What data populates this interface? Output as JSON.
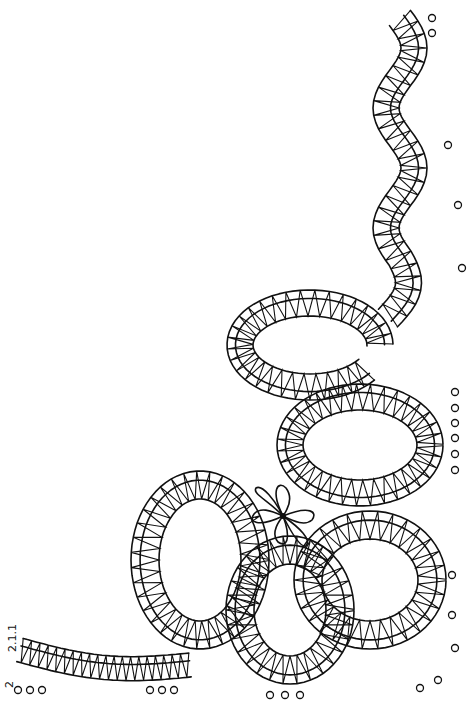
{
  "figure": {
    "labels": {
      "pair_count_top": "2.1.1",
      "pair_count_bottom": "2"
    },
    "colors": {
      "line": "#111111",
      "background": "#ffffff"
    }
  }
}
